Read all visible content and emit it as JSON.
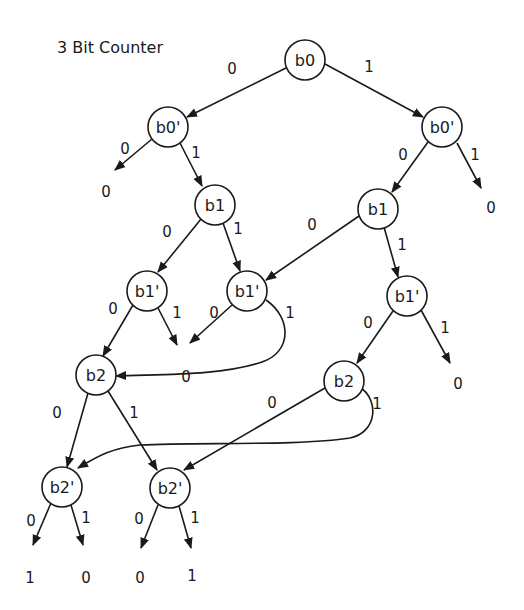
{
  "title": "3 Bit Counter",
  "colors": {
    "ink": "#1a1a1a",
    "background": "#ffffff"
  },
  "nodes": [
    {
      "id": "b0",
      "label": "b0",
      "x": 305,
      "y": 60
    },
    {
      "id": "b0p_l",
      "label": "b0'",
      "x": 168,
      "y": 127
    },
    {
      "id": "b0p_r",
      "label": "b0'",
      "x": 442,
      "y": 127
    },
    {
      "id": "b1_l",
      "label": "b1",
      "x": 215,
      "y": 205
    },
    {
      "id": "b1_r",
      "label": "b1",
      "x": 378,
      "y": 209
    },
    {
      "id": "b1p_ll",
      "label": "b1'",
      "x": 147,
      "y": 291
    },
    {
      "id": "b1p_lr",
      "label": "b1'",
      "x": 247,
      "y": 291
    },
    {
      "id": "b1p_r",
      "label": "b1'",
      "x": 407,
      "y": 296
    },
    {
      "id": "b2_l",
      "label": "b2",
      "x": 96,
      "y": 375
    },
    {
      "id": "b2_r",
      "label": "b2",
      "x": 344,
      "y": 381
    },
    {
      "id": "b2p_l",
      "label": "b2'",
      "x": 62,
      "y": 487
    },
    {
      "id": "b2p_r",
      "label": "b2'",
      "x": 170,
      "y": 488
    }
  ],
  "edge_labels": [
    {
      "text": "0",
      "x": 232,
      "y": 74
    },
    {
      "text": "1",
      "x": 369,
      "y": 72
    },
    {
      "text": "0",
      "x": 125,
      "y": 154
    },
    {
      "text": "1",
      "x": 196,
      "y": 158
    },
    {
      "text": "0",
      "x": 403,
      "y": 160
    },
    {
      "text": "1",
      "x": 475,
      "y": 160
    },
    {
      "text": "0",
      "x": 167,
      "y": 237
    },
    {
      "text": "1",
      "x": 238,
      "y": 234
    },
    {
      "text": "0",
      "x": 312,
      "y": 230
    },
    {
      "text": "1",
      "x": 402,
      "y": 250
    },
    {
      "text": "0",
      "x": 113,
      "y": 314
    },
    {
      "text": "1",
      "x": 177,
      "y": 318
    },
    {
      "text": "0",
      "x": 214,
      "y": 318
    },
    {
      "text": "1",
      "x": 290,
      "y": 318
    },
    {
      "text": "0",
      "x": 368,
      "y": 328
    },
    {
      "text": "1",
      "x": 445,
      "y": 333
    },
    {
      "text": "0",
      "x": 57,
      "y": 418
    },
    {
      "text": "1",
      "x": 134,
      "y": 418
    },
    {
      "text": "0",
      "x": 272,
      "y": 408
    },
    {
      "text": "1",
      "x": 377,
      "y": 409
    },
    {
      "text": "0",
      "x": 31,
      "y": 526
    },
    {
      "text": "1",
      "x": 86,
      "y": 523
    },
    {
      "text": "0",
      "x": 139,
      "y": 524
    },
    {
      "text": "1",
      "x": 195,
      "y": 523
    }
  ],
  "leaf_values": [
    {
      "text": "0",
      "x": 106,
      "y": 197
    },
    {
      "text": "0",
      "x": 491,
      "y": 213
    },
    {
      "text": "0",
      "x": 186,
      "y": 382
    },
    {
      "text": "0",
      "x": 458,
      "y": 389
    },
    {
      "text": "1",
      "x": 30,
      "y": 583
    },
    {
      "text": "0",
      "x": 86,
      "y": 583
    },
    {
      "text": "0",
      "x": 140,
      "y": 583
    },
    {
      "text": "1",
      "x": 192,
      "y": 581
    }
  ]
}
